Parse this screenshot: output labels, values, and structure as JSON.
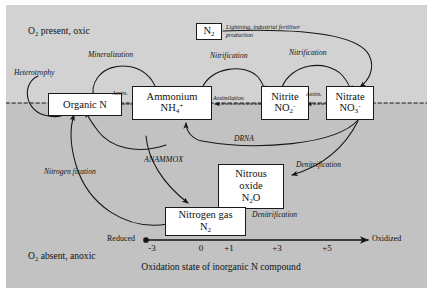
{
  "figure": {
    "zone_top_label": "O₂ present, oxic",
    "zone_bottom_label": "O₂ absent, anoxic",
    "axis_title": "Oxidation state of inorganic N compound",
    "axis_left_label": "Reduced",
    "axis_right_label": "Oxidized",
    "axis_ticks": [
      "-3",
      "0",
      "+1",
      "+3",
      "+5"
    ],
    "boundary_style": "dashed",
    "colors": {
      "oxic_background": "#d2d2d2",
      "anoxic_background": "#c2c2c2",
      "box_fill": "#ffffff",
      "stroke": "#1a1a1a"
    }
  },
  "boxes": [
    {
      "id": "organic-n",
      "name": "Organic N",
      "line1": "Organic N",
      "line2": "",
      "line3": ""
    },
    {
      "id": "ammonium",
      "name": "Ammonium",
      "line1": "Ammonium",
      "line2": "NH4+",
      "line3": ""
    },
    {
      "id": "nitrite",
      "name": "Nitrite",
      "line1": "Nitrite",
      "line2": "NO2-",
      "line3": ""
    },
    {
      "id": "nitrate",
      "name": "Nitrate",
      "line1": "Nitrate",
      "line2": "NO3-",
      "line3": ""
    },
    {
      "id": "dinitrogen",
      "name": "N2",
      "line1": "N2",
      "line2": "",
      "line3": ""
    },
    {
      "id": "nitrous-oxide",
      "name": "Nitrous oxide",
      "line1": "Nitrous",
      "line2": "oxide",
      "line3": "N2O"
    },
    {
      "id": "nitrogen-gas",
      "name": "Nitrogen gas",
      "line1": "Nitrogen gas",
      "line2": "N2",
      "line3": ""
    }
  ],
  "process_labels": {
    "heterotrophy": "Heterotrophy",
    "mineralization_top": "Mineralization",
    "mineralization_bottom": "Mineralization",
    "assim_organic": "Assim.",
    "assimilation": "Assimilation",
    "assim_nitrate": "Assim.",
    "nitrification_left": "Nitrification",
    "nitrification_right": "Nitrification",
    "lightning": "Lightning, industrial fertiliser production",
    "drna": "DRNA",
    "anammox": "ANAMMOX",
    "nitrogen_fixation": "Nitrogen fixation",
    "denitrification_upper": "Denitrification",
    "denitrification_lower": "Denitrification"
  }
}
